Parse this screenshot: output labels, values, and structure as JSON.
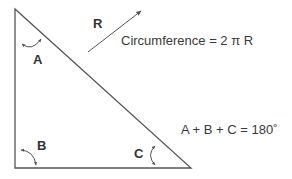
{
  "diagram": {
    "type": "right-triangle",
    "angles": {
      "A": "A",
      "B": "B",
      "C": "C"
    },
    "radius_label": "R",
    "formulas": {
      "circumference": "Circumference = 2 π R",
      "angle_sum": "A + B + C = 180˚"
    },
    "colors": {
      "stroke": "#555555",
      "text": "#333333",
      "background": "#ffffff"
    }
  }
}
